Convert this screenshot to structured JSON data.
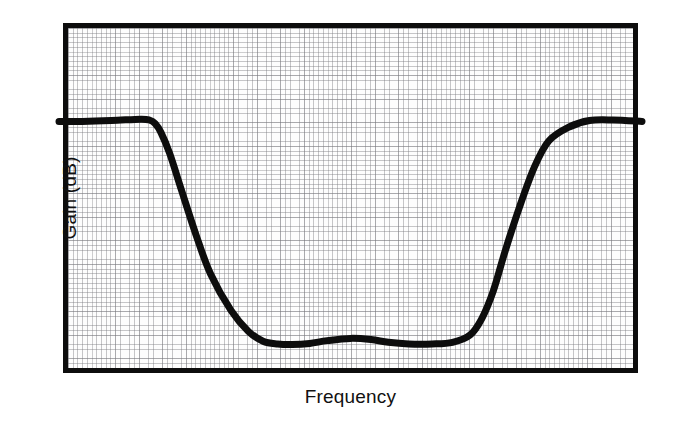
{
  "figure": {
    "background_color": "#ffffff",
    "ink_color": "#0d0d0d",
    "grid_color": "#787880",
    "frame": {
      "left": 63,
      "top": 23,
      "width": 575,
      "height": 350,
      "border_px": 5
    }
  },
  "axes": {
    "xlabel": "Frequency",
    "ylabel": "Gain (dB)"
  },
  "chart_data": {
    "type": "line",
    "title": "",
    "subtitle": "",
    "xlabel": "Frequency",
    "ylabel": "Gain (dB)",
    "grid": true,
    "grid_style": "fine square engineering grid, no tick labels",
    "legend": null,
    "legend_position": "none",
    "annotations": [],
    "axis_tick_labels": {
      "x": [],
      "y": []
    },
    "xlim": [
      0,
      1
    ],
    "ylim": [
      -1,
      0.05
    ],
    "x_units": "normalized frequency (unlabeled axis)",
    "y_units": "relative gain in dB (unlabeled axis)",
    "series": [
      {
        "name": "Band-stop filter magnitude response",
        "color": "#0d0d0d",
        "line_width_px": 7,
        "x": [
          0.0,
          0.04,
          0.09,
          0.14,
          0.155,
          0.165,
          0.175,
          0.19,
          0.21,
          0.235,
          0.26,
          0.295,
          0.325,
          0.35,
          0.375,
          0.4,
          0.43,
          0.46,
          0.5,
          0.535,
          0.565,
          0.6,
          0.64,
          0.675,
          0.705,
          0.725,
          0.745,
          0.765,
          0.79,
          0.815,
          0.84,
          0.875,
          0.91,
          0.95,
          1.0
        ],
        "y": [
          -0.155,
          -0.155,
          -0.152,
          -0.147,
          -0.15,
          -0.163,
          -0.195,
          -0.27,
          -0.4,
          -0.56,
          -0.7,
          -0.83,
          -0.905,
          -0.94,
          -0.95,
          -0.952,
          -0.948,
          -0.938,
          -0.93,
          -0.934,
          -0.944,
          -0.95,
          -0.95,
          -0.944,
          -0.918,
          -0.86,
          -0.76,
          -0.62,
          -0.46,
          -0.32,
          -0.225,
          -0.175,
          -0.152,
          -0.15,
          -0.155
        ]
      }
    ],
    "features": {
      "passband_level_db_relative": 0,
      "stopband_depth_db_relative": -0.95,
      "left_transition_x": [
        0.16,
        0.33
      ],
      "stopband_x": [
        0.33,
        0.7
      ],
      "right_transition_x": [
        0.7,
        0.85
      ],
      "stopband_ripple": true
    }
  }
}
